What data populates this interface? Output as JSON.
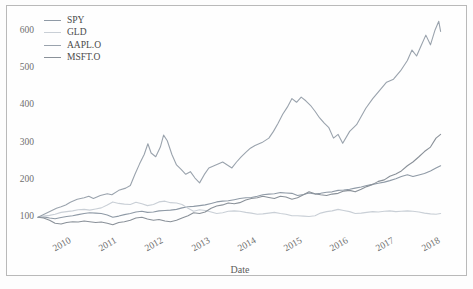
{
  "chart_data": {
    "type": "line",
    "title": "",
    "xlabel": "Date",
    "ylabel": "",
    "grid": false,
    "legend_position": "upper-left",
    "xlim": [
      2010.0,
      2018.75
    ],
    "ylim": [
      55,
      650
    ],
    "yticks": [
      100,
      200,
      300,
      400,
      500,
      600
    ],
    "xticks": [
      "2010",
      "2011",
      "2012",
      "2013",
      "2014",
      "2015",
      "2016",
      "2017",
      "2018"
    ],
    "xtick_values": [
      2010,
      2011,
      2012,
      2013,
      2014,
      2015,
      2016,
      2017,
      2018
    ],
    "note": "Normalized price index, base = 100 at start of 2010",
    "series": [
      {
        "name": "SPY",
        "color": "#8f9aa6",
        "x": [
          2010.0,
          2010.12,
          2010.25,
          2010.37,
          2010.5,
          2010.62,
          2010.75,
          2010.87,
          2011.0,
          2011.12,
          2011.25,
          2011.37,
          2011.5,
          2011.62,
          2011.75,
          2011.87,
          2012.0,
          2012.12,
          2012.25,
          2012.37,
          2012.5,
          2012.62,
          2012.75,
          2012.87,
          2013.0,
          2013.12,
          2013.25,
          2013.37,
          2013.5,
          2013.62,
          2013.75,
          2013.87,
          2014.0,
          2014.12,
          2014.25,
          2014.37,
          2014.5,
          2014.62,
          2014.75,
          2014.87,
          2015.0,
          2015.12,
          2015.25,
          2015.37,
          2015.5,
          2015.62,
          2015.75,
          2015.87,
          2016.0,
          2016.12,
          2016.25,
          2016.37,
          2016.5,
          2016.62,
          2016.75,
          2016.87,
          2017.0,
          2017.12,
          2017.25,
          2017.37,
          2017.5,
          2017.62,
          2017.75,
          2017.87,
          2018.0,
          2018.12,
          2018.25,
          2018.37,
          2018.5,
          2018.62,
          2018.72
        ],
        "values": [
          100,
          101,
          98,
          96,
          99,
          102,
          104,
          107,
          110,
          112,
          111,
          110,
          106,
          100,
          103,
          107,
          110,
          114,
          116,
          113,
          114,
          117,
          118,
          119,
          121,
          125,
          128,
          129,
          131,
          133,
          137,
          141,
          143,
          144,
          147,
          150,
          152,
          153,
          156,
          160,
          162,
          163,
          166,
          165,
          164,
          158,
          161,
          165,
          162,
          164,
          167,
          168,
          172,
          173,
          175,
          178,
          181,
          185,
          188,
          191,
          194,
          198,
          203,
          209,
          214,
          209,
          213,
          217,
          224,
          232,
          238
        ]
      },
      {
        "name": "GLD",
        "color": "#c9cfd6",
        "x": [
          2010.0,
          2010.12,
          2010.25,
          2010.37,
          2010.5,
          2010.62,
          2010.75,
          2010.87,
          2011.0,
          2011.12,
          2011.25,
          2011.37,
          2011.5,
          2011.62,
          2011.75,
          2011.87,
          2012.0,
          2012.12,
          2012.25,
          2012.37,
          2012.5,
          2012.62,
          2012.75,
          2012.87,
          2013.0,
          2013.12,
          2013.25,
          2013.37,
          2013.5,
          2013.62,
          2013.75,
          2013.87,
          2014.0,
          2014.12,
          2014.25,
          2014.37,
          2014.5,
          2014.62,
          2014.75,
          2014.87,
          2015.0,
          2015.12,
          2015.25,
          2015.37,
          2015.5,
          2015.62,
          2015.75,
          2015.87,
          2016.0,
          2016.12,
          2016.25,
          2016.37,
          2016.5,
          2016.62,
          2016.75,
          2016.87,
          2017.0,
          2017.12,
          2017.25,
          2017.37,
          2017.5,
          2017.62,
          2017.75,
          2017.87,
          2018.0,
          2018.12,
          2018.25,
          2018.37,
          2018.5,
          2018.62,
          2018.72
        ],
        "values": [
          100,
          103,
          105,
          108,
          113,
          115,
          117,
          120,
          121,
          119,
          122,
          125,
          133,
          141,
          137,
          135,
          134,
          140,
          136,
          131,
          134,
          141,
          143,
          139,
          138,
          134,
          124,
          116,
          120,
          118,
          114,
          110,
          112,
          116,
          117,
          116,
          113,
          111,
          108,
          109,
          111,
          113,
          110,
          108,
          104,
          104,
          103,
          102,
          104,
          111,
          115,
          117,
          121,
          118,
          115,
          110,
          111,
          113,
          115,
          114,
          116,
          117,
          115,
          116,
          117,
          116,
          114,
          111,
          109,
          108,
          110
        ]
      },
      {
        "name": "AAPL.O",
        "color": "#9aa3ad",
        "x": [
          2010.0,
          2010.1,
          2010.2,
          2010.3,
          2010.4,
          2010.5,
          2010.6,
          2010.7,
          2010.85,
          2011.0,
          2011.1,
          2011.2,
          2011.35,
          2011.5,
          2011.6,
          2011.75,
          2011.9,
          2012.0,
          2012.1,
          2012.2,
          2012.3,
          2012.38,
          2012.45,
          2012.55,
          2012.65,
          2012.72,
          2012.8,
          2012.9,
          2013.0,
          2013.1,
          2013.2,
          2013.3,
          2013.4,
          2013.5,
          2013.6,
          2013.7,
          2013.85,
          2014.0,
          2014.1,
          2014.2,
          2014.3,
          2014.4,
          2014.5,
          2014.6,
          2014.7,
          2014.85,
          2015.0,
          2015.1,
          2015.2,
          2015.3,
          2015.4,
          2015.5,
          2015.6,
          2015.7,
          2015.8,
          2015.9,
          2016.0,
          2016.1,
          2016.2,
          2016.3,
          2016.4,
          2016.5,
          2016.6,
          2016.75,
          2016.9,
          2017.0,
          2017.1,
          2017.25,
          2017.4,
          2017.55,
          2017.7,
          2017.85,
          2018.0,
          2018.1,
          2018.2,
          2018.3,
          2018.4,
          2018.5,
          2018.6,
          2018.68,
          2018.72
        ],
        "values": [
          100,
          106,
          112,
          118,
          124,
          128,
          133,
          140,
          148,
          152,
          156,
          150,
          158,
          163,
          160,
          172,
          178,
          185,
          215,
          243,
          268,
          297,
          272,
          262,
          288,
          320,
          305,
          268,
          240,
          228,
          215,
          222,
          205,
          192,
          214,
          232,
          240,
          248,
          240,
          232,
          248,
          262,
          274,
          285,
          292,
          300,
          312,
          330,
          352,
          376,
          395,
          418,
          408,
          422,
          412,
          400,
          384,
          366,
          352,
          340,
          312,
          322,
          298,
          330,
          348,
          370,
          392,
          418,
          440,
          462,
          470,
          492,
          520,
          548,
          532,
          560,
          588,
          562,
          602,
          625,
          598
        ]
      },
      {
        "name": "MSFT.O",
        "color": "#8a9199",
        "x": [
          2010.0,
          2010.12,
          2010.25,
          2010.37,
          2010.5,
          2010.62,
          2010.75,
          2010.87,
          2011.0,
          2011.12,
          2011.25,
          2011.37,
          2011.5,
          2011.62,
          2011.75,
          2011.87,
          2012.0,
          2012.12,
          2012.25,
          2012.37,
          2012.5,
          2012.62,
          2012.75,
          2012.87,
          2013.0,
          2013.12,
          2013.25,
          2013.37,
          2013.5,
          2013.62,
          2013.75,
          2013.87,
          2014.0,
          2014.12,
          2014.25,
          2014.37,
          2014.5,
          2014.62,
          2014.75,
          2014.87,
          2015.0,
          2015.12,
          2015.25,
          2015.37,
          2015.5,
          2015.62,
          2015.75,
          2015.87,
          2016.0,
          2016.12,
          2016.25,
          2016.37,
          2016.5,
          2016.62,
          2016.75,
          2016.87,
          2017.0,
          2017.12,
          2017.25,
          2017.37,
          2017.5,
          2017.62,
          2017.75,
          2017.87,
          2018.0,
          2018.12,
          2018.25,
          2018.37,
          2018.5,
          2018.62,
          2018.72
        ],
        "values": [
          100,
          98,
          92,
          84,
          82,
          86,
          88,
          87,
          90,
          88,
          86,
          87,
          84,
          80,
          86,
          88,
          92,
          98,
          100,
          95,
          92,
          94,
          90,
          88,
          92,
          98,
          104,
          112,
          110,
          114,
          124,
          130,
          133,
          138,
          136,
          139,
          146,
          150,
          152,
          156,
          153,
          150,
          156,
          154,
          148,
          152,
          160,
          168,
          163,
          160,
          158,
          162,
          164,
          170,
          172,
          168,
          175,
          182,
          188,
          196,
          200,
          210,
          216,
          224,
          238,
          248,
          262,
          276,
          288,
          312,
          322
        ]
      }
    ]
  },
  "legend": {
    "items": [
      {
        "label": "SPY",
        "color": "#8f9aa6"
      },
      {
        "label": "GLD",
        "color": "#c9cfd6"
      },
      {
        "label": "AAPL.O",
        "color": "#9aa3ad"
      },
      {
        "label": "MSFT.O",
        "color": "#8a9199"
      }
    ]
  },
  "axis": {
    "x_title": "Date",
    "y_ticks": [
      "600",
      "500",
      "400",
      "300",
      "200",
      "100"
    ],
    "x_ticks": [
      "2010",
      "2011",
      "2012",
      "2013",
      "2014",
      "2015",
      "2016",
      "2017",
      "2018"
    ]
  },
  "colors": {
    "frame": "#b9b9b9",
    "tick_text": "#6f6f6f",
    "axis_title": "#5c5c5c",
    "plot_background": "#fefefe"
  }
}
